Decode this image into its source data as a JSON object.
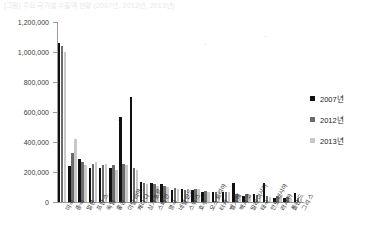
{
  "caption": "[그림] 주요 국가별 수출액 현황 (2007년, 2012년, 2013년)",
  "chart_data": {
    "type": "bar",
    "title": "",
    "xlabel": "",
    "ylabel": "",
    "ylim": [
      0,
      1200000
    ],
    "grid": false,
    "legend_position": "right",
    "ytick_labels": [
      "1,200,000",
      "1,000,000",
      "800,000",
      "600,000",
      "400,000",
      "200,000",
      "0"
    ],
    "ytick_values": [
      1200000,
      1000000,
      800000,
      600000,
      400000,
      200000,
      0
    ],
    "categories": [
      "미국",
      "중국",
      "일본",
      "프랑스",
      "독일",
      "홍콩",
      "이탈리아",
      "캐나다",
      "싱가포르",
      "스페인",
      "영국",
      "네덜란드",
      "스위스",
      "호주",
      "오스트리아",
      "터키",
      "벨기에",
      "멕시코",
      "말레이시아",
      "태국",
      "인도네시아",
      "러시아",
      "폴란드",
      "그리스"
    ],
    "series": [
      {
        "name": "2007년",
        "color": "#111111",
        "values": [
          1058000,
          240000,
          290000,
          225000,
          230000,
          225000,
          570000,
          700000,
          135000,
          125000,
          120000,
          80000,
          85000,
          80000,
          70000,
          70000,
          70000,
          130000,
          40000,
          55000,
          130000,
          30000,
          25000,
          60000
        ]
      },
      {
        "name": "2012년",
        "color": "#6b6b6b",
        "values": [
          1040000,
          330000,
          270000,
          255000,
          250000,
          250000,
          255000,
          230000,
          130000,
          120000,
          110000,
          95000,
          80000,
          90000,
          75000,
          70000,
          70000,
          55000,
          55000,
          50000,
          40000,
          40000,
          35000,
          25000
        ]
      },
      {
        "name": "2013년",
        "color": "#c9c9c9",
        "values": [
          1000000,
          420000,
          250000,
          265000,
          255000,
          215000,
          250000,
          215000,
          120000,
          110000,
          100000,
          90000,
          85000,
          85000,
          70000,
          65000,
          70000,
          50000,
          50000,
          45000,
          35000,
          35000,
          30000,
          20000
        ]
      }
    ]
  },
  "legend": {
    "items": [
      {
        "label": "2007년",
        "color": "#111111"
      },
      {
        "label": "2012년",
        "color": "#6b6b6b"
      },
      {
        "label": "2013년",
        "color": "#c9c9c9"
      }
    ]
  }
}
